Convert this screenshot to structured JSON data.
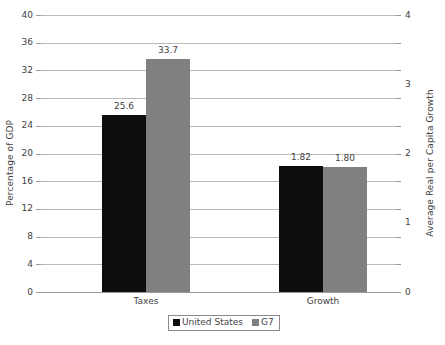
{
  "chart_data": {
    "type": "bar",
    "title": "",
    "subtitle": "",
    "categories": [
      "Taxes",
      "Growth"
    ],
    "series": [
      {
        "name": "United States",
        "color": "#0d0d0d",
        "values": [
          25.6,
          1.82
        ],
        "labels": [
          "25.6",
          "1.82"
        ],
        "axis": [
          "left",
          "right"
        ]
      },
      {
        "name": "G7",
        "color": "#808080",
        "values": [
          33.7,
          1.8
        ],
        "labels": [
          "33.7",
          "1.80"
        ],
        "axis": [
          "left",
          "right"
        ]
      }
    ],
    "axes": {
      "left": {
        "label": "Percentage of GDP",
        "ticks": [
          "0",
          "4",
          "8",
          "12",
          "16",
          "20",
          "24",
          "28",
          "32",
          "36",
          "40"
        ],
        "min": 0,
        "max": 40,
        "step": 4
      },
      "right": {
        "label": "Average Real per Capita Growth",
        "ticks": [
          "0",
          "1",
          "2",
          "3",
          "4"
        ],
        "minor_ticks": [
          "0.5",
          "1.5",
          "2.5",
          "3.5"
        ],
        "min": 0,
        "max": 4,
        "step": 1
      },
      "x": {
        "label": "",
        "ticks": [
          "Taxes",
          "Growth"
        ]
      }
    },
    "grid": true,
    "legend": {
      "position": "bottom-center",
      "entries": [
        {
          "label": "United States",
          "color": "#0d0d0d"
        },
        {
          "label": "G7",
          "color": "#808080"
        }
      ]
    }
  }
}
